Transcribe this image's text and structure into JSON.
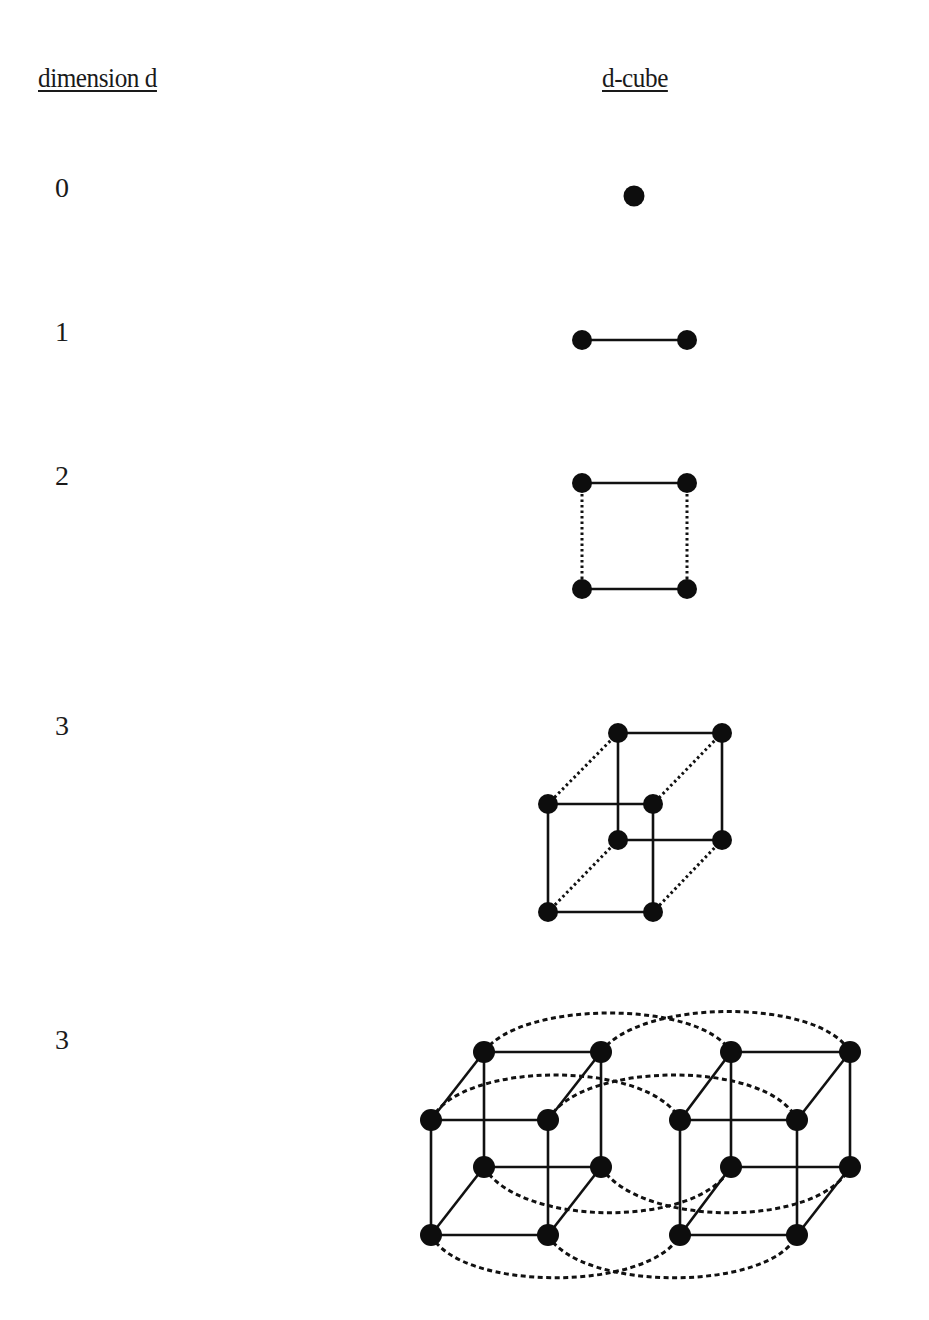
{
  "headers": {
    "dimension": "dimension d",
    "cube": "d-cube"
  },
  "rows": [
    {
      "dimension": "0",
      "figure": "point",
      "vertices": 1,
      "edges": 0
    },
    {
      "dimension": "1",
      "figure": "segment",
      "vertices": 2,
      "edges": 1
    },
    {
      "dimension": "2",
      "figure": "square",
      "vertices": 4,
      "edges": 4
    },
    {
      "dimension": "3",
      "figure": "cube",
      "vertices": 8,
      "edges": 12
    },
    {
      "dimension": "3",
      "figure": "hypercube-two-cubes-linked",
      "vertices": 16,
      "edges": 32
    }
  ],
  "colors": {
    "ink": "#111111",
    "background": "#ffffff"
  }
}
